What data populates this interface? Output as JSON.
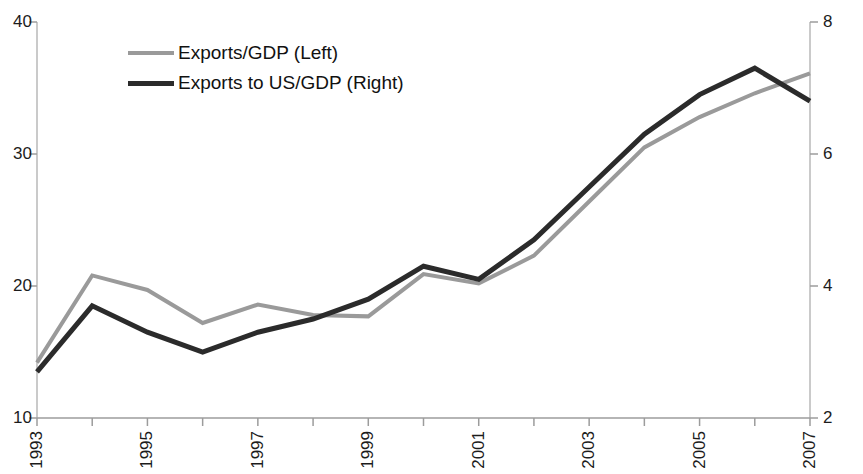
{
  "chart_data": {
    "type": "line",
    "title": "",
    "subtitle": "",
    "xlabel": "",
    "ylabel": "",
    "grid": false,
    "legend_position": "top-left",
    "x": [
      1993,
      1994,
      1995,
      1996,
      1997,
      1998,
      1999,
      2000,
      2001,
      2002,
      2003,
      2004,
      2005,
      2006,
      2007
    ],
    "x_tick_labels": [
      "1993",
      "",
      "1995",
      "",
      "1997",
      "",
      "1999",
      "",
      "2001",
      "",
      "2003",
      "",
      "2005",
      "",
      "2007"
    ],
    "x_tick_labels_shown": [
      "1993",
      "1995",
      "1997",
      "1999",
      "2001",
      "2003",
      "2005",
      "2007"
    ],
    "axes": {
      "left": {
        "label": "",
        "ylim": [
          10,
          40
        ],
        "ticks": [
          10,
          20,
          30,
          40
        ],
        "tick_labels": [
          "10",
          "20",
          "30",
          "40"
        ]
      },
      "right": {
        "label": "",
        "ylim": [
          2,
          8
        ],
        "ticks": [
          2,
          4,
          6,
          8
        ],
        "tick_labels": [
          "2",
          "4",
          "6",
          "8"
        ]
      }
    },
    "series": [
      {
        "name": "Exports/GDP (Left)",
        "axis": "left",
        "color": "#9a9a9a",
        "linewidth": 4,
        "values": [
          14.2,
          20.8,
          19.7,
          17.2,
          18.6,
          17.8,
          17.7,
          20.9,
          20.2,
          22.3,
          26.4,
          30.5,
          32.8,
          34.6,
          36.1
        ]
      },
      {
        "name": "Exports to US/GDP (Right)",
        "axis": "right",
        "color": "#2b2b2b",
        "linewidth": 5,
        "values": [
          2.7,
          3.7,
          3.3,
          3.0,
          3.3,
          3.5,
          3.8,
          4.3,
          4.1,
          4.7,
          5.5,
          6.3,
          6.9,
          7.3,
          6.8
        ]
      }
    ],
    "legend": [
      {
        "label": "Exports/GDP (Left)",
        "color": "#9a9a9a",
        "style": "thin"
      },
      {
        "label": "Exports to US/GDP (Right)",
        "color": "#2b2b2b",
        "style": "thick"
      }
    ]
  }
}
